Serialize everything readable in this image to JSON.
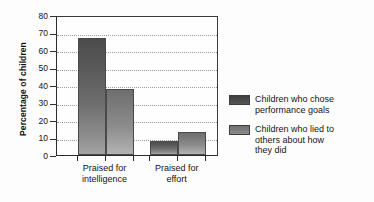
{
  "chart_data": {
    "type": "bar",
    "title": "",
    "xlabel": "",
    "ylabel": "Percentage of children",
    "ylim": [
      0,
      80
    ],
    "yticks": [
      0,
      10,
      20,
      30,
      40,
      50,
      60,
      70,
      80
    ],
    "grid": true,
    "legend_position": "right",
    "categories": [
      "Praised for intelligence",
      "Praised for effort"
    ],
    "category_lines": [
      [
        "Praised for",
        "intelligence"
      ],
      [
        "Praised for",
        "effort"
      ]
    ],
    "series": [
      {
        "name": "Children who chose performance goals",
        "name_lines": [
          "Children who chose",
          "performance goals"
        ],
        "color": "#4c4c4c",
        "values": [
          67,
          8
        ]
      },
      {
        "name": "Children who lied to others about how they did",
        "name_lines": [
          "Children who lied to",
          "others about how",
          "they did"
        ],
        "color": "#8d8d8d",
        "values": [
          38,
          13
        ]
      }
    ]
  },
  "axis": {
    "y_title": "Percentage of children"
  }
}
